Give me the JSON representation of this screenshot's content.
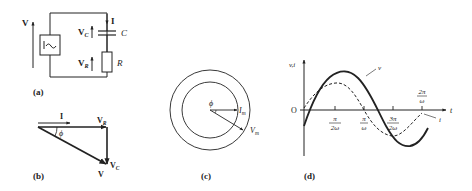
{
  "panels": {
    "a": {
      "caption": "(a)",
      "source_symbol": "~",
      "labels": {
        "V": "V",
        "I": "I",
        "VC_main": "V",
        "VC_sub": "C",
        "C": "C",
        "VR_main": "V",
        "VR_sub": "R",
        "R": "R"
      }
    },
    "b": {
      "caption": "(b)",
      "labels": {
        "I": "I",
        "VR_main": "V",
        "VR_sub": "R",
        "phi": "ϕ",
        "VC_main": "V",
        "VC_sub": "C",
        "V": "V"
      }
    },
    "c": {
      "caption": "(c)",
      "labels": {
        "phi": "ϕ",
        "Im_main": "I",
        "Im_sub": "m",
        "Vm_main": "V",
        "Vm_sub": "m"
      }
    },
    "d": {
      "caption": "(d)",
      "axis": {
        "y_label": "v,i",
        "x_label": "t",
        "origin": "O"
      },
      "ticks": [
        {
          "num": "π",
          "den": "2ω"
        },
        {
          "num": "π",
          "den": "ω"
        },
        {
          "num": "3π",
          "den": "2ω"
        },
        {
          "num": "2π",
          "den": "ω"
        }
      ],
      "curve_labels": {
        "v": "v",
        "i": "i"
      }
    }
  },
  "colors": {
    "ink": "#222222",
    "background": "#ffffff"
  }
}
